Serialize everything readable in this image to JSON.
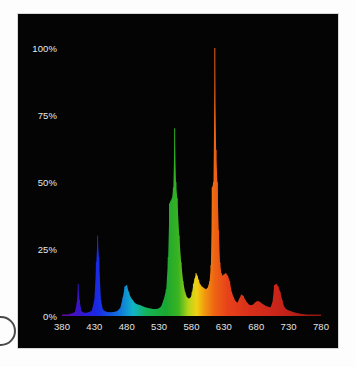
{
  "chart_data": {
    "type": "area",
    "title": "Relative Spectral Power Distribution",
    "xlabel": "Wavelength (nm)",
    "ylabel": "Relative Radiant Power",
    "xlim": [
      380,
      780
    ],
    "ylim": [
      0,
      100
    ],
    "grid": false,
    "legend": null,
    "background_color": "#040404",
    "x_tick_labels": [
      "380",
      "430",
      "480",
      "530",
      "580",
      "630",
      "680",
      "730",
      "780"
    ],
    "x_ticks": [
      380,
      430,
      480,
      530,
      580,
      630,
      680,
      730,
      780
    ],
    "y_tick_labels": [
      "100%",
      "75%",
      "50%",
      "25%",
      "0%"
    ],
    "y_ticks": [
      100,
      75,
      50,
      25,
      0
    ],
    "series_name": "Relative power",
    "x": [
      380,
      384,
      388,
      392,
      396,
      400,
      403,
      405,
      407,
      410,
      414,
      418,
      422,
      426,
      430,
      433,
      435,
      437,
      440,
      443,
      446,
      450,
      455,
      460,
      465,
      470,
      474,
      477,
      480,
      483,
      486,
      489,
      492,
      495,
      498,
      501,
      505,
      509,
      513,
      517,
      521,
      525,
      529,
      533,
      537,
      541,
      544,
      546,
      548,
      550,
      552,
      554,
      556,
      558,
      561,
      564,
      567,
      570,
      573,
      576,
      579,
      581,
      583,
      585,
      587,
      589,
      591,
      593,
      596,
      599,
      602,
      605,
      608,
      610,
      612,
      614,
      616,
      618,
      620,
      622,
      624,
      626,
      628,
      630,
      633,
      636,
      639,
      642,
      645,
      648,
      651,
      654,
      657,
      660,
      663,
      666,
      669,
      672,
      675,
      678,
      681,
      684,
      687,
      690,
      693,
      696,
      699,
      702,
      705,
      708,
      711,
      714,
      717,
      720,
      723,
      726,
      729,
      733,
      737,
      741,
      745,
      750,
      756,
      762,
      770,
      780
    ],
    "values": [
      0,
      0,
      0.5,
      0.8,
      1.0,
      1.5,
      5.0,
      12.0,
      6.0,
      1.8,
      1.2,
      1.2,
      1.5,
      2.0,
      6.0,
      20.0,
      30.0,
      22.0,
      6.0,
      2.5,
      1.8,
      1.5,
      1.4,
      1.5,
      1.8,
      3.0,
      7.0,
      11.0,
      11.5,
      9.0,
      7.0,
      6.0,
      5.0,
      4.5,
      4.2,
      4.0,
      3.6,
      3.2,
      3.0,
      2.8,
      2.6,
      2.6,
      2.8,
      3.5,
      6.0,
      10.0,
      22.0,
      42.0,
      43.0,
      44.0,
      48.0,
      70.0,
      50.0,
      44.0,
      30.0,
      20.0,
      13.0,
      9.0,
      7.0,
      6.5,
      7.0,
      9.0,
      12.0,
      14.0,
      16.0,
      15.0,
      13.5,
      12.0,
      11.0,
      10.5,
      10.0,
      10.5,
      13.0,
      19.0,
      48.0,
      50.0,
      100.0,
      62.0,
      50.0,
      32.0,
      20.0,
      16.0,
      15.0,
      15.5,
      16.0,
      15.0,
      13.0,
      9.0,
      7.0,
      5.5,
      5.0,
      6.5,
      8.0,
      7.5,
      6.0,
      5.0,
      4.2,
      4.0,
      4.2,
      5.0,
      5.5,
      5.5,
      5.0,
      4.5,
      4.0,
      3.6,
      3.4,
      3.2,
      5.0,
      11.5,
      12.0,
      11.0,
      9.0,
      6.0,
      3.5,
      2.6,
      2.2,
      1.8,
      1.5,
      1.2,
      1.0,
      0.8,
      0.6,
      0.4,
      0.2,
      0
    ],
    "annotations": [
      {
        "label": "violet line",
        "x": 405,
        "y": 12
      },
      {
        "label": "blue line",
        "x": 435,
        "y": 30
      },
      {
        "label": "cyan band",
        "x": 480,
        "y": 11.5
      },
      {
        "label": "green line",
        "x": 554,
        "y": 70
      },
      {
        "label": "green shoulder",
        "x": 547,
        "y": 43
      },
      {
        "label": "yellow band",
        "x": 587,
        "y": 16
      },
      {
        "label": "orange-red line",
        "x": 616,
        "y": 100
      },
      {
        "label": "red step",
        "x": 612,
        "y": 48
      },
      {
        "label": "deep red bump",
        "x": 711,
        "y": 12
      }
    ],
    "color_stops": [
      {
        "wavelength": 380,
        "color": "#6a0aa0"
      },
      {
        "wavelength": 405,
        "color": "#3a14c8"
      },
      {
        "wavelength": 435,
        "color": "#1a2ae6"
      },
      {
        "wavelength": 470,
        "color": "#1178dc"
      },
      {
        "wavelength": 490,
        "color": "#12b4c8"
      },
      {
        "wavelength": 510,
        "color": "#16b45a"
      },
      {
        "wavelength": 540,
        "color": "#1aa832"
      },
      {
        "wavelength": 560,
        "color": "#3cb422"
      },
      {
        "wavelength": 575,
        "color": "#b4d41a"
      },
      {
        "wavelength": 588,
        "color": "#f0d214"
      },
      {
        "wavelength": 600,
        "color": "#f29a10"
      },
      {
        "wavelength": 615,
        "color": "#ee6614"
      },
      {
        "wavelength": 635,
        "color": "#e8431a"
      },
      {
        "wavelength": 670,
        "color": "#d8301c"
      },
      {
        "wavelength": 720,
        "color": "#c6241a"
      },
      {
        "wavelength": 780,
        "color": "#8c1410"
      }
    ]
  }
}
